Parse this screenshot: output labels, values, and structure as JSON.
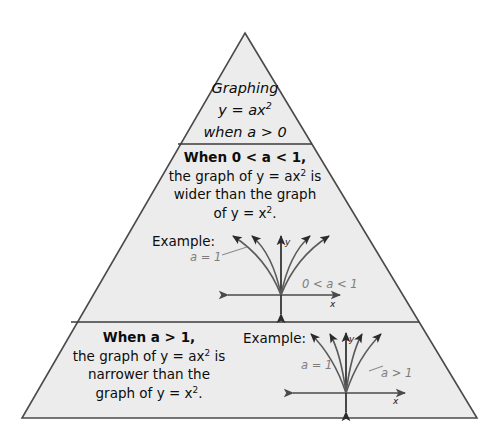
{
  "figure": {
    "type": "pyramid-diagram",
    "shape": "triangle",
    "fill_color": "#ececec",
    "stroke_color": "#4a4a4a",
    "background_color": "#ffffff",
    "annotation_color": "#7d7d7d",
    "text_color": "#0d0d0d"
  },
  "tier1": {
    "line1": "Graphing",
    "line2_prefix": "y = ax",
    "line2_sup": "2",
    "line3": "when a > 0"
  },
  "tier2": {
    "heading": "When 0 < a < 1,",
    "line2_a": "the graph of y = ax",
    "line2_sup": "2",
    "line2_b": " is",
    "line3": "wider than the graph",
    "line4_a": "of y = x",
    "line4_sup": "2",
    "line4_b": ".",
    "example_label": "Example:",
    "graph": {
      "curve_label_1": "a = 1",
      "curve_label_2": "0 < a < 1",
      "y_axis_label": "y",
      "x_axis_label": "x",
      "curve_count": 4,
      "description": "wider parabolas"
    }
  },
  "tier3": {
    "heading": "When a > 1,",
    "line2_a": "the graph of y = ax",
    "line2_sup": "2",
    "line2_b": " is",
    "line3": "narrower than the",
    "line4_a": "graph of y = x",
    "line4_sup": "2",
    "line4_b": ".",
    "example_label": "Example:",
    "graph": {
      "curve_label_1": "a = 1",
      "curve_label_2": "a > 1",
      "y_axis_label": "y",
      "x_axis_label": "x",
      "curve_count": 4,
      "description": "narrower parabolas"
    }
  }
}
